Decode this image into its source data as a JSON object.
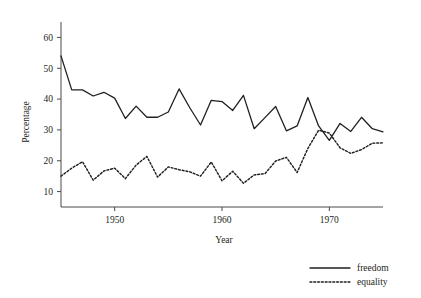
{
  "chart_data": {
    "type": "line",
    "title": "",
    "xlabel": "Year",
    "ylabel": "Percentage",
    "xlim": [
      1945,
      1975
    ],
    "ylim": [
      5,
      65
    ],
    "grid": false,
    "legend_position": "bottom-right",
    "xticks": [
      1950,
      1960,
      1970
    ],
    "xticklabels": [
      "1950",
      "1960",
      "1970"
    ],
    "yticks": [
      10,
      20,
      30,
      40,
      50,
      60
    ],
    "yticklabels": [
      "10",
      "20",
      "30",
      "40",
      "50",
      "60"
    ],
    "x": [
      1945,
      1946,
      1947,
      1948,
      1949,
      1950,
      1951,
      1952,
      1953,
      1954,
      1955,
      1956,
      1957,
      1958,
      1959,
      1960,
      1961,
      1962,
      1963,
      1964,
      1965,
      1966,
      1967,
      1968,
      1969,
      1970,
      1971,
      1972,
      1973,
      1974,
      1975
    ],
    "series": [
      {
        "name": "freedom",
        "style": "solid",
        "color": "#231f20",
        "values": [
          54.0,
          43.0,
          43.0,
          41.0,
          42.2,
          40.3,
          33.7,
          37.7,
          34.1,
          34.1,
          35.8,
          43.3,
          37.2,
          31.6,
          39.6,
          39.2,
          36.3,
          41.2,
          30.4,
          34.0,
          37.6,
          29.7,
          31.3,
          40.5,
          31.3,
          26.6,
          32.1,
          29.5,
          34.1,
          30.4,
          29.4
        ]
      },
      {
        "name": "equality",
        "style": "dotted",
        "color": "#231f20",
        "values": [
          15.0,
          17.6,
          19.7,
          13.7,
          16.7,
          17.6,
          14.2,
          18.6,
          21.4,
          14.7,
          18.0,
          17.1,
          16.4,
          15.0,
          19.6,
          13.5,
          16.6,
          12.7,
          15.4,
          15.8,
          19.9,
          21.1,
          16.2,
          24.0,
          29.9,
          29.0,
          24.2,
          22.4,
          23.6,
          25.7,
          25.8
        ]
      }
    ],
    "legend": [
      {
        "label": "freedom",
        "style": "solid"
      },
      {
        "label": "equality",
        "style": "dotted"
      }
    ]
  }
}
